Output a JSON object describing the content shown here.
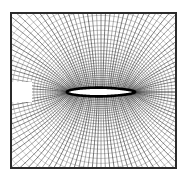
{
  "figure": {
    "title": "",
    "caption": "",
    "background_color": "#ffffff",
    "ink_color": "#1a1a1a",
    "frame": {
      "label": "outer-domain-boundary",
      "x": 11,
      "y": 13,
      "width": 165,
      "height": 155,
      "stroke_color": "#2b2b2b",
      "stroke_width": 2.0
    },
    "margin": {
      "left": 11,
      "top": 13,
      "right": 14,
      "bottom": 17
    }
  },
  "chart_data": {
    "type": "line",
    "title": "",
    "subtitle": "",
    "xlabel": "",
    "ylabel": "",
    "grid": true,
    "legend": [],
    "annotations": [],
    "plot_kind": "structured-o-grid-mesh-around-slender-body",
    "xlim": [
      11,
      176
    ],
    "ylim": [
      13,
      168
    ],
    "body": {
      "name": "slender-ellipse-body",
      "center_x": 101,
      "center_y": 92,
      "semi_major_a": 34,
      "semi_minor_b": 4.4,
      "leading_edge_x": 67,
      "trailing_edge_x": 135,
      "fill_color": "#ffffff",
      "outline_color": "#000000",
      "outline_width": 2.6
    },
    "radial_lines": {
      "count": 120,
      "description": "radial mesh lines emanating from body surface to outer boundary",
      "stroke_color": "#262626",
      "stroke_width_min": 0.28,
      "stroke_width_max": 0.62
    },
    "ring_lines": {
      "count": 34,
      "description": "concentric elliptical circumferential mesh lines wrapping the body",
      "stroke_color": "#303030",
      "stroke_width_min": 0.26,
      "stroke_width_max": 0.55,
      "innermost_scale": 1.06,
      "outermost_scale": 9.2,
      "growth_ratio": 1.072
    },
    "wake_cut": {
      "name": "upstream-inflow-blank-region",
      "x": 12,
      "y": 82,
      "width": 20,
      "height": 20,
      "fill_color": "#ffffff"
    },
    "downstream_cut": {
      "name": "downstream-wake-line",
      "from_x": 135,
      "to_x": 176,
      "y": 92
    }
  }
}
